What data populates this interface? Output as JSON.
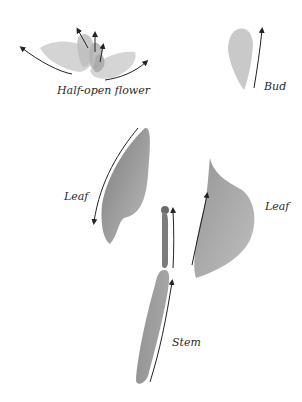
{
  "diagram": {
    "title": "",
    "parts": [
      {
        "id": "half-open-flower",
        "label": "Half-open flower"
      },
      {
        "id": "bud",
        "label": "Bud"
      },
      {
        "id": "leaf-left",
        "label": "Leaf"
      },
      {
        "id": "leaf-right",
        "label": "Leaf"
      },
      {
        "id": "stem",
        "label": "Stem"
      }
    ],
    "colors": {
      "background": "#ffffff",
      "ink_light": "#c8c8c8",
      "ink_mid": "#a0a0a0",
      "ink_dark": "#7a7a7a",
      "stroke_arrow": "#222222"
    }
  }
}
